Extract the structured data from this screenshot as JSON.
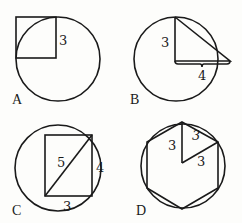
{
  "panels": [
    {
      "id": "A",
      "label": "A",
      "description": "Square with side 3 whose corner sits on circle center",
      "measurements": {
        "square_side": "3"
      }
    },
    {
      "id": "B",
      "label": "B",
      "description": "Right triangle with legs 3 and 4 from circle center",
      "measurements": {
        "vertical_leg": "3",
        "horizontal_leg": "4"
      }
    },
    {
      "id": "C",
      "label": "C",
      "description": "Rectangle 3 by 4 inscribed in circle with diagonal 5",
      "measurements": {
        "diagonal": "5",
        "height": "4",
        "width": "3"
      }
    },
    {
      "id": "D",
      "label": "D",
      "description": "Regular hexagon inscribed in circle with side 3",
      "measurements": {
        "radius_1": "3",
        "side": "3",
        "radius_2": "3"
      }
    }
  ]
}
